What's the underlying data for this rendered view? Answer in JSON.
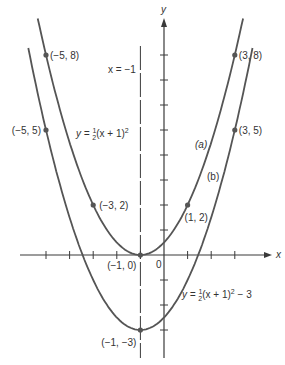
{
  "chart_data": {
    "type": "line",
    "title": "",
    "xlabel": "x",
    "ylabel": "y",
    "xlim": [
      -6,
      4
    ],
    "ylim": [
      -4,
      9
    ],
    "grid": false,
    "x_ticks": [
      -5,
      -4,
      -3,
      -2,
      -1,
      0,
      1,
      2,
      3
    ],
    "y_ticks": [
      -3,
      -2,
      -1,
      0,
      1,
      2,
      3,
      4,
      5,
      6,
      7,
      8
    ],
    "origin_label": "0",
    "axis_of_symmetry": {
      "label": "x = −1",
      "x": -1,
      "style": "dashed"
    },
    "series": [
      {
        "name": "(a)",
        "equation": "y = ½(x + 1)²",
        "eq_prefix": "y = ",
        "eq_frac": "1/2",
        "eq_body": "(x + 1)",
        "eq_exp": "2",
        "eq_suffix": "",
        "points": [
          {
            "x": -5,
            "y": 8,
            "label": "(−5, 8)"
          },
          {
            "x": -3,
            "y": 2,
            "label": "(−3, 2)"
          },
          {
            "x": -1,
            "y": 0,
            "label": "(−1, 0)"
          },
          {
            "x": 1,
            "y": 2,
            "label": "(1, 2)"
          },
          {
            "x": 3,
            "y": 8,
            "label": "(3, 8)"
          }
        ]
      },
      {
        "name": "(b)",
        "equation": "y = ½(x + 1)² − 3",
        "eq_prefix": "y = ",
        "eq_frac": "1/2",
        "eq_body": "(x + 1)",
        "eq_exp": "2",
        "eq_suffix": " − 3",
        "points": [
          {
            "x": -5,
            "y": 5,
            "label": "(−5, 5)"
          },
          {
            "x": -1,
            "y": -3,
            "label": "(−1, −3)"
          },
          {
            "x": 3,
            "y": 5,
            "label": "(3, 5)"
          }
        ]
      }
    ]
  },
  "colors": {
    "curve": "#555555",
    "axis": "#3a3a3a",
    "point": "#555555"
  }
}
